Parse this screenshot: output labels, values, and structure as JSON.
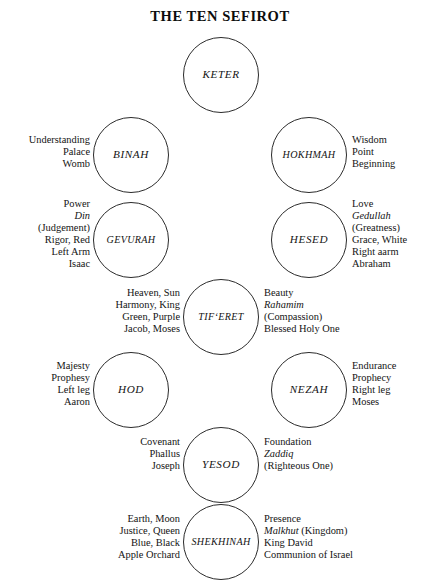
{
  "title": "THE TEN SEFIROT",
  "sefirot": [
    {
      "id": "keter",
      "name": "KETER",
      "left_lines": [],
      "right_lines": []
    },
    {
      "id": "binah",
      "name": "BINAH",
      "left_lines": [
        "Understanding",
        "Palace",
        "Womb"
      ],
      "right_lines": []
    },
    {
      "id": "hokhmah",
      "name": "HOKHMAH",
      "left_lines": [],
      "right_lines": [
        "Wisdom",
        "Point",
        "Beginning"
      ]
    },
    {
      "id": "gevurah",
      "name": "GEVURAH",
      "left_lines": [
        "Power",
        "Din",
        "(Judgement)",
        "Rigor, Red",
        "Left Arm",
        "Isaac"
      ],
      "left_italic_lines": [
        1
      ],
      "right_lines": []
    },
    {
      "id": "hesed",
      "name": "HESED",
      "left_lines": [],
      "right_lines": [
        "Love",
        "Gedullah",
        "(Greatness)",
        "Grace, White",
        "Right aarm",
        "Abraham"
      ],
      "right_italic_lines": [
        1
      ]
    },
    {
      "id": "tiferet",
      "name": "TIFʻERET",
      "left_lines": [
        "Heaven, Sun",
        "Harmony, King",
        "Green, Purple",
        "Jacob, Moses"
      ],
      "right_lines": [
        "Beauty",
        "Rahamim",
        "(Compassion)",
        "Blessed Holy One"
      ],
      "right_italic_lines": [
        1
      ]
    },
    {
      "id": "hod",
      "name": "HOD",
      "left_lines": [
        "Majesty",
        "Prophesy",
        "Left leg",
        "Aaron"
      ],
      "right_lines": []
    },
    {
      "id": "nezah",
      "name": "NEZAH",
      "left_lines": [],
      "right_lines": [
        "Endurance",
        "Prophecy",
        "Right leg",
        "Moses"
      ]
    },
    {
      "id": "yesod",
      "name": "YESOD",
      "left_lines": [
        "Covenant",
        "Phallus",
        "Joseph"
      ],
      "right_lines": [
        "Foundation",
        "Zaddiq",
        "(Righteous One)"
      ],
      "right_italic_lines": [
        1
      ]
    },
    {
      "id": "shekhinah",
      "name": "SHEKHINAH",
      "left_lines": [
        "Earth, Moon",
        "Justice, Queen",
        "Blue, Black",
        "Apple Orchard"
      ],
      "right_lines": [
        "Presence",
        "Malkhut (Kingdom)",
        "King David",
        "Communion of Israel"
      ],
      "right_italic_prefix": {
        "1": "Malkhut"
      }
    }
  ],
  "colors": {
    "ink": "#141414",
    "outline": "#2b2b2b",
    "background": "#ffffff"
  }
}
